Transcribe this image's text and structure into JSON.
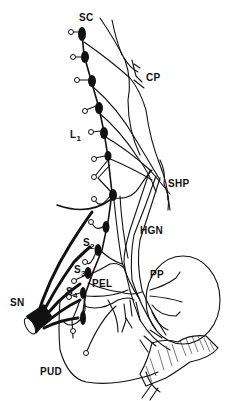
{
  "figure": {
    "labels": {
      "sc": "SC",
      "cp": "CP",
      "l1_main": "L",
      "l1_sub": "1",
      "shp": "SHP",
      "hgn": "HGN",
      "s2_main": "S",
      "s2_sub": "2",
      "s3_main": "S",
      "s3_sub": "3",
      "s4_main": "S",
      "s4_sub": "4",
      "pel": "PEL",
      "pp": "PP",
      "sn": "SN",
      "pud": "PUD"
    },
    "colors": {
      "ink": "#111111",
      "background": "#ffffff"
    }
  }
}
